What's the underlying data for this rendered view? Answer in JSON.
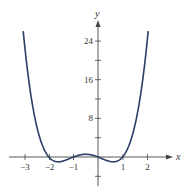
{
  "chart_data": {
    "type": "line",
    "title": "",
    "function": "y = x^4 + 2x^3 - x^2 - 2x",
    "xlabel": "x",
    "ylabel": "y",
    "xlim": [
      -3.5,
      3.2
    ],
    "ylim": [
      -5,
      28
    ],
    "x_ticks": [
      -3,
      -2,
      -1,
      1,
      2
    ],
    "x_tick_labels": [
      "−3",
      "−2",
      "−1",
      "1",
      "2"
    ],
    "y_ticks_minor": [
      -4,
      4,
      12,
      20
    ],
    "y_ticks": [
      8,
      16,
      24
    ],
    "y_tick_labels": [
      "8",
      "16",
      "24"
    ],
    "grid": false,
    "legend": null,
    "series": [
      {
        "name": "f(x)",
        "color": "#2c3e66",
        "x": [
          -3.0,
          -2.5,
          -2.0,
          -1.6,
          -1.0,
          -0.5,
          0.0,
          0.6,
          1.0,
          1.5,
          2.0
        ],
        "y": [
          24,
          6.56,
          0,
          -1.0,
          0,
          0.56,
          0,
          -1.0,
          0,
          4.69,
          24
        ]
      }
    ]
  },
  "labels": {
    "x_axis": "x",
    "y_axis": "y",
    "x_ticks": [
      "−3",
      "−2",
      "−1",
      "1",
      "2"
    ],
    "y_ticks": [
      "24",
      "16",
      "8"
    ]
  }
}
